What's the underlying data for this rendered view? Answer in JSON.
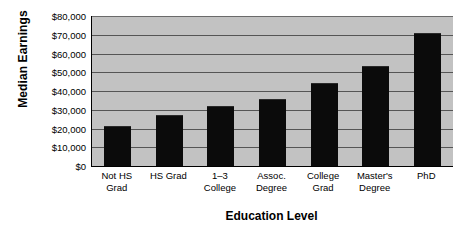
{
  "chart_data": {
    "type": "bar",
    "title": "",
    "xlabel": "Education Level",
    "ylabel": "Median Earnings",
    "categories": [
      "Not HS Grad",
      "HS Grad",
      "1–3 College",
      "Assoc. Degree",
      "College Grad",
      "Master's Degree",
      "PhD"
    ],
    "values": [
      21500,
      27000,
      32000,
      35500,
      44500,
      53500,
      71000
    ],
    "ylim": [
      0,
      80000
    ],
    "ytick_values": [
      0,
      10000,
      20000,
      30000,
      40000,
      50000,
      60000,
      70000,
      80000
    ],
    "ytick_labels": [
      "$0",
      "$10,000",
      "$20,000",
      "$30,000",
      "$40,000",
      "$50,000",
      "$60,000",
      "$70,000",
      "$80,000"
    ],
    "grid": true,
    "legend": false,
    "bar_color": "#0b0b0b",
    "plot_background": "#c2c2c2",
    "figure_background": "#ffffff"
  },
  "axes": {
    "y_title": "Median Earnings",
    "x_title": "Education Level"
  },
  "x_label_lines": [
    [
      "Not HS",
      "Grad"
    ],
    [
      "HS Grad",
      ""
    ],
    [
      "1–3 College",
      ""
    ],
    [
      "Assoc.",
      "Degree"
    ],
    [
      "College",
      "Grad"
    ],
    [
      "Master's",
      "Degree"
    ],
    [
      "PhD",
      ""
    ]
  ]
}
